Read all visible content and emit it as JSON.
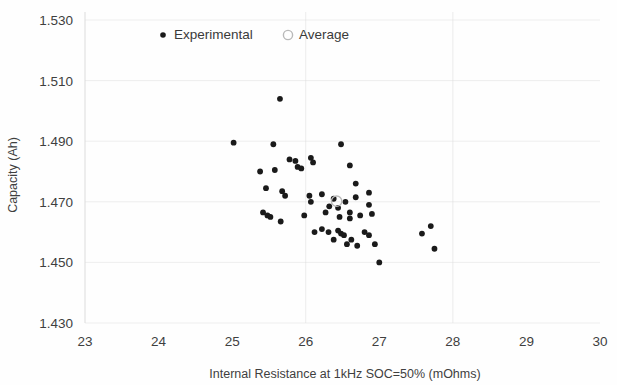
{
  "chart_data": {
    "type": "scatter",
    "title": "",
    "xlabel": "Internal Resistance at 1kHz SOC=50% (mOhms)",
    "ylabel": "Capacity (Ah)",
    "xlim": [
      23,
      30
    ],
    "ylim": [
      1.43,
      1.53
    ],
    "xticks": [
      "23",
      "24",
      "25",
      "26",
      "27",
      "28",
      "29",
      "30"
    ],
    "yticks": [
      "1.530",
      "1.510",
      "1.490",
      "1.470",
      "1.450",
      "1.430"
    ],
    "grid": "horizontal-faint",
    "legend_position": "top-center",
    "legend": [
      {
        "name": "Experimental",
        "marker": "filled-circle",
        "color": "#1a1a1a"
      },
      {
        "name": "Average",
        "marker": "open-circle",
        "color": "#b9b9b9"
      }
    ],
    "series": [
      {
        "name": "Experimental",
        "marker": "filled-circle",
        "color": "#1a1a1a",
        "points": [
          [
            25.65,
            1.504
          ],
          [
            25.02,
            1.4895
          ],
          [
            25.56,
            1.489
          ],
          [
            26.48,
            1.489
          ],
          [
            25.78,
            1.484
          ],
          [
            25.86,
            1.4835
          ],
          [
            25.89,
            1.4815
          ],
          [
            25.94,
            1.481
          ],
          [
            26.07,
            1.4845
          ],
          [
            26.1,
            1.483
          ],
          [
            25.38,
            1.48
          ],
          [
            25.58,
            1.4805
          ],
          [
            26.6,
            1.482
          ],
          [
            26.68,
            1.476
          ],
          [
            25.46,
            1.4745
          ],
          [
            25.68,
            1.4735
          ],
          [
            25.72,
            1.472
          ],
          [
            26.86,
            1.473
          ],
          [
            25.42,
            1.4665
          ],
          [
            25.48,
            1.4655
          ],
          [
            25.52,
            1.465
          ],
          [
            25.66,
            1.4635
          ],
          [
            26.05,
            1.472
          ],
          [
            26.07,
            1.47
          ],
          [
            26.22,
            1.4725
          ],
          [
            26.38,
            1.471
          ],
          [
            26.54,
            1.47
          ],
          [
            26.68,
            1.4715
          ],
          [
            26.32,
            1.4685
          ],
          [
            26.44,
            1.468
          ],
          [
            26.6,
            1.4665
          ],
          [
            26.86,
            1.469
          ],
          [
            25.98,
            1.4655
          ],
          [
            26.27,
            1.4665
          ],
          [
            26.46,
            1.465
          ],
          [
            26.6,
            1.4645
          ],
          [
            26.74,
            1.4655
          ],
          [
            26.9,
            1.466
          ],
          [
            26.12,
            1.46
          ],
          [
            26.22,
            1.461
          ],
          [
            26.31,
            1.46
          ],
          [
            26.44,
            1.4605
          ],
          [
            26.48,
            1.4595
          ],
          [
            26.52,
            1.459
          ],
          [
            26.38,
            1.4575
          ],
          [
            26.56,
            1.456
          ],
          [
            26.62,
            1.4575
          ],
          [
            26.7,
            1.4555
          ],
          [
            26.8,
            1.46
          ],
          [
            26.86,
            1.459
          ],
          [
            26.94,
            1.456
          ],
          [
            27.0,
            1.45
          ],
          [
            27.7,
            1.462
          ],
          [
            27.58,
            1.4595
          ],
          [
            27.75,
            1.4545
          ]
        ]
      },
      {
        "name": "Average",
        "marker": "open-circle",
        "color": "#b9b9b9",
        "points": [
          [
            26.42,
            1.4702
          ]
        ]
      }
    ]
  }
}
